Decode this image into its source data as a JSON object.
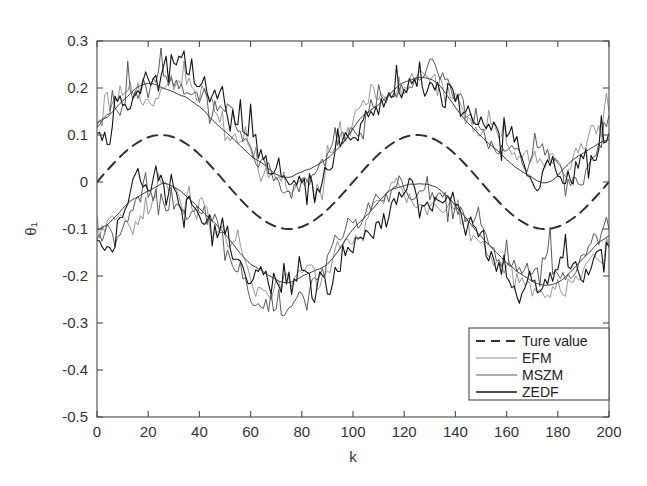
{
  "figure": {
    "width": 647,
    "height": 486,
    "background": "#ffffff"
  },
  "chart_data": {
    "type": "line",
    "title": "",
    "xlabel": "k",
    "ylabel": "θ₁",
    "xlim": [
      0,
      200
    ],
    "ylim": [
      -0.5,
      0.3
    ],
    "xticks": [
      0,
      20,
      40,
      60,
      80,
      100,
      120,
      140,
      160,
      180,
      200
    ],
    "xticklabels": [
      "0",
      "20",
      "40",
      "60",
      "80",
      "100",
      "120",
      "140",
      "160",
      "180",
      "200"
    ],
    "yticks": [
      -0.5,
      -0.4,
      -0.3,
      -0.2,
      -0.1,
      0,
      0.1,
      0.2,
      0.3
    ],
    "yticklabels": [
      "-0.5",
      "-0.4",
      "-0.3",
      "-0.2",
      "-0.1",
      "0",
      "0.1",
      "0.2",
      "0.3"
    ],
    "grid": false,
    "legend_position": "lower-right",
    "legend_entries": [
      "Ture value",
      "EFM",
      "MSZM",
      "ZEDF"
    ],
    "series": [
      {
        "name": "Ture value",
        "style": "dashed",
        "color": "#303030",
        "width": 2.0,
        "description": "Smooth sinusoid, amplitude 0.1, period 100 samples, mean 0, starting near 0 and rising",
        "model": "sine",
        "amplitude": 0.1,
        "period": 100,
        "phase": 0,
        "offset": 0,
        "x": [
          0,
          5,
          10,
          15,
          20,
          25,
          30,
          35,
          40,
          45,
          50,
          55,
          60,
          65,
          70,
          75,
          80,
          85,
          90,
          95,
          100,
          105,
          110,
          115,
          120,
          125,
          130,
          135,
          140,
          145,
          150,
          155,
          160,
          165,
          170,
          175,
          180,
          185,
          190,
          195,
          200
        ],
        "values": [
          0.0,
          0.031,
          0.059,
          0.081,
          0.095,
          0.1,
          0.095,
          0.081,
          0.059,
          0.031,
          0.0,
          -0.031,
          -0.059,
          -0.081,
          -0.095,
          -0.1,
          -0.095,
          -0.081,
          -0.059,
          -0.031,
          0.0,
          0.031,
          0.059,
          0.081,
          0.095,
          0.1,
          0.095,
          0.081,
          0.059,
          0.031,
          0.0,
          -0.031,
          -0.059,
          -0.081,
          -0.095,
          -0.1,
          -0.095,
          -0.081,
          -0.059,
          -0.031,
          0.0
        ]
      },
      {
        "name": "EFM",
        "style": "solid",
        "color": "#8c8c8c",
        "width": 0.9,
        "band": "both",
        "description": "Noisy estimate forming two bands above and below true value; upper band ~ true + 0.115, lower band ~ true - 0.115, with high-frequency noise",
        "band_offset_upper": 0.115,
        "band_offset_lower": -0.115,
        "noise_amplitude": 0.03,
        "noise_seed": 17
      },
      {
        "name": "MSZM",
        "style": "solid",
        "color": "#5a5a5a",
        "width": 1.0,
        "band": "both",
        "description": "Noisy estimate forming two bands above and below true value with spiky noise",
        "band_offset_upper": 0.118,
        "band_offset_lower": -0.118,
        "noise_amplitude": 0.034,
        "noise_seed": 41
      },
      {
        "name": "ZEDF",
        "style": "solid",
        "color": "#111111",
        "width": 1.1,
        "band": "both",
        "description": "Noisy estimate forming two bands, darkest trace, largest spikes",
        "band_offset_upper": 0.112,
        "band_offset_lower": -0.112,
        "noise_amplitude": 0.042,
        "noise_seed": 73
      },
      {
        "name": "ZEDF-smooth-upper",
        "style": "solid",
        "color": "#3a3a3a",
        "width": 1.0,
        "band": "upper",
        "description": "Smoothed dark envelope trace riding through the upper noisy band",
        "band_offset_upper": 0.112,
        "noise_amplitude": 0.012,
        "noise_seed": 5
      },
      {
        "name": "ZEDF-smooth-lower",
        "style": "solid",
        "color": "#3a3a3a",
        "width": 1.0,
        "band": "lower",
        "description": "Smoothed dark envelope trace riding through the lower noisy band",
        "band_offset_lower": -0.112,
        "noise_amplitude": 0.012,
        "noise_seed": 9
      }
    ],
    "n_samples": 201
  },
  "axes": {
    "plot_left": 97,
    "plot_right": 609,
    "plot_top": 41,
    "plot_bottom": 417,
    "frame_color": "#4a4a4a",
    "tick_color": "#4a4a4a",
    "label_color": "#333333"
  },
  "legend": {
    "x": 469,
    "y": 328,
    "width": 140,
    "height": 72,
    "border_color": "#4a4a4a",
    "background": "#ffffff",
    "items": [
      {
        "label": "Ture value",
        "style": "dashed",
        "color": "#303030",
        "width": 2.0
      },
      {
        "label": "EFM",
        "style": "solid",
        "color": "#8c8c8c",
        "width": 1.0
      },
      {
        "label": "MSZM",
        "style": "solid",
        "color": "#5a5a5a",
        "width": 1.2
      },
      {
        "label": "ZEDF",
        "style": "solid",
        "color": "#111111",
        "width": 1.6
      }
    ]
  }
}
